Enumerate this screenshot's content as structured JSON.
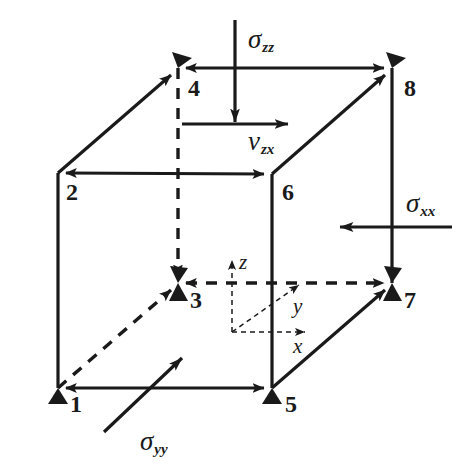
{
  "figure": {
    "kind": "stress-element-cube-diagram",
    "stroke_color": "#1a1a1a",
    "background_color": "#ffffff"
  },
  "nodes": [
    {
      "id": "node-1",
      "label": "1",
      "x": 58,
      "y": 388,
      "label_x": 70,
      "label_y": 392,
      "hidden": false
    },
    {
      "id": "node-2",
      "label": "2",
      "x": 58,
      "y": 173,
      "label_x": 66,
      "label_y": 180,
      "hidden": false
    },
    {
      "id": "node-3",
      "label": "3",
      "x": 178,
      "y": 283,
      "label_x": 190,
      "label_y": 288,
      "hidden": true
    },
    {
      "id": "node-4",
      "label": "4",
      "x": 178,
      "y": 68,
      "label_x": 188,
      "label_y": 76,
      "hidden": false
    },
    {
      "id": "node-5",
      "label": "5",
      "x": 272,
      "y": 388,
      "label_x": 285,
      "label_y": 392,
      "hidden": false
    },
    {
      "id": "node-6",
      "label": "6",
      "x": 272,
      "y": 174,
      "label_x": 282,
      "label_y": 180,
      "hidden": false
    },
    {
      "id": "node-7",
      "label": "7",
      "x": 392,
      "y": 283,
      "label_x": 404,
      "label_y": 288,
      "hidden": true
    },
    {
      "id": "node-8",
      "label": "8",
      "x": 392,
      "y": 68,
      "label_x": 404,
      "label_y": 76,
      "hidden": false
    }
  ],
  "edges": [
    {
      "id": "edge-2-6",
      "from": "2",
      "to": "6",
      "style": "solid",
      "arrow": "both"
    },
    {
      "id": "edge-6-5",
      "from": "6",
      "to": "5",
      "style": "solid",
      "arrow": "none"
    },
    {
      "id": "edge-1-5",
      "from": "1",
      "to": "5",
      "style": "solid",
      "arrow": "both"
    },
    {
      "id": "edge-2-1",
      "from": "2",
      "to": "1",
      "style": "solid",
      "arrow": "none"
    },
    {
      "id": "edge-4-8",
      "from": "4",
      "to": "8",
      "style": "solid",
      "arrow": "both"
    },
    {
      "id": "edge-8-7",
      "from": "8",
      "to": "7",
      "style": "solid",
      "arrow": "none"
    },
    {
      "id": "edge-2-4",
      "from": "2",
      "to": "4",
      "style": "solid",
      "arrow": "to"
    },
    {
      "id": "edge-6-8",
      "from": "6",
      "to": "8",
      "style": "solid",
      "arrow": "to"
    },
    {
      "id": "edge-5-7",
      "from": "5",
      "to": "7",
      "style": "solid",
      "arrow": "to"
    },
    {
      "id": "edge-4-3",
      "from": "4",
      "to": "3",
      "style": "dashed",
      "arrow": "to"
    },
    {
      "id": "edge-3-7",
      "from": "3",
      "to": "7",
      "style": "dashed",
      "arrow": "both"
    },
    {
      "id": "edge-1-3",
      "from": "1",
      "to": "3",
      "style": "dashed",
      "arrow": "to"
    }
  ],
  "load_arrows": [
    {
      "id": "sigma-zz-arrow",
      "name": "sigma-zz",
      "direction": "down",
      "x1": 235,
      "y1": 20,
      "x2": 235,
      "y2": 122,
      "label": {
        "base": "σ",
        "sub": "zz",
        "x": 248,
        "y": 26
      }
    },
    {
      "id": "v-zx-arrow",
      "name": "v-zx",
      "direction": "right",
      "x1": 182,
      "y1": 124,
      "x2": 288,
      "y2": 124,
      "label": {
        "base": "v",
        "sub": "zx",
        "x": 248,
        "y": 128
      }
    },
    {
      "id": "sigma-xx-arrow",
      "name": "sigma-xx",
      "direction": "left",
      "x1": 452,
      "y1": 227,
      "x2": 340,
      "y2": 227,
      "label": {
        "base": "σ",
        "sub": "xx",
        "x": 406,
        "y": 190
      }
    },
    {
      "id": "sigma-yy-arrow",
      "name": "sigma-yy",
      "direction": "up-right",
      "x1": 104,
      "y1": 432,
      "x2": 182,
      "y2": 358,
      "label": {
        "base": "σ",
        "sub": "yy",
        "x": 140,
        "y": 428
      }
    }
  ],
  "coordinate_triad": {
    "origin_x": 232,
    "origin_y": 332,
    "axes": [
      {
        "id": "axis-z",
        "label": "z",
        "x2": 232,
        "y2": 258,
        "label_x": 239,
        "label_y": 252
      },
      {
        "id": "axis-y",
        "label": "y",
        "x2": 300,
        "y2": 284,
        "label_x": 293,
        "label_y": 296
      },
      {
        "id": "axis-x",
        "label": "x",
        "x2": 306,
        "y2": 332,
        "label_x": 293,
        "label_y": 336
      }
    ]
  }
}
